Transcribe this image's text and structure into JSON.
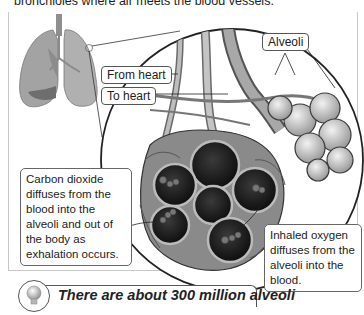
{
  "intro_text": "bronchioles where air meets the blood vessels.",
  "labels": {
    "alveoli": "Alveoli",
    "from_heart": "From heart",
    "to_heart": "To heart"
  },
  "callouts": {
    "carbon_dioxide": "Carbon dioxide diffuses from the blood into the alveoli and out of the body as exhalation occurs.",
    "oxygen": "Inhaled oxygen diffuses from the alveoli into the blood."
  },
  "fact": {
    "icon": "lightbulb-icon",
    "text": "There are about 300 million alveoli"
  },
  "colors": {
    "line": "#333333",
    "frame": "#c8c8c8",
    "lung_fill": "#a0a0a0",
    "alveolus_dark": "#1e1e1e",
    "tissue": "#8a8a8a"
  }
}
